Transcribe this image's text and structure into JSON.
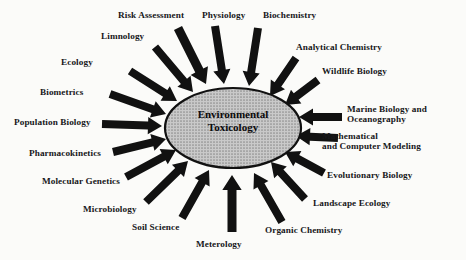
{
  "figure": {
    "type": "radial-convergence-diagram",
    "background_color": "#fbfbf9",
    "center": {
      "label": "Environmental\nToxicology",
      "line1": "Environmental",
      "line2": "Toxicology",
      "shape": "ellipse",
      "fill_color": "#a6a6a6",
      "fill_pattern": "halftone-dots",
      "stroke_color": "#111111",
      "cx": 233,
      "cy": 128,
      "rx": 68,
      "ry": 40
    },
    "arrow_color": "#111111",
    "arrow_style": "block-arrow",
    "contributing_field_count": 19,
    "nodes": [
      {
        "id": "risk-assessment",
        "label": "Risk Assessment",
        "label_x": 118,
        "label_y": 10,
        "arrow": {
          "x1": 178,
          "y1": 28,
          "x2": 206,
          "y2": 84,
          "width": 9,
          "head": 15
        }
      },
      {
        "id": "physiology",
        "label": "Physiology",
        "label_x": 202,
        "label_y": 10,
        "arrow": {
          "x1": 215,
          "y1": 26,
          "x2": 224,
          "y2": 84,
          "width": 8,
          "head": 14
        }
      },
      {
        "id": "biochemistry",
        "label": "Biochemistry",
        "label_x": 263,
        "label_y": 10,
        "arrow": {
          "x1": 258,
          "y1": 28,
          "x2": 249,
          "y2": 86,
          "width": 8,
          "head": 14
        }
      },
      {
        "id": "limnology",
        "label": "Limnology",
        "label_x": 101,
        "label_y": 31,
        "arrow": {
          "x1": 155,
          "y1": 47,
          "x2": 193,
          "y2": 92,
          "width": 8,
          "head": 14
        }
      },
      {
        "id": "analytical-chemistry",
        "label": "Analytical Chemistry",
        "label_x": 296,
        "label_y": 42,
        "arrow": {
          "x1": 296,
          "y1": 58,
          "x2": 270,
          "y2": 96,
          "width": 8,
          "head": 14
        }
      },
      {
        "id": "ecology",
        "label": "Ecology",
        "label_x": 61,
        "label_y": 57,
        "arrow": {
          "x1": 130,
          "y1": 71,
          "x2": 177,
          "y2": 101,
          "width": 8,
          "head": 14
        }
      },
      {
        "id": "wildlife-biology",
        "label": "Wildlife Biology",
        "label_x": 322,
        "label_y": 66,
        "arrow": {
          "x1": 318,
          "y1": 80,
          "x2": 285,
          "y2": 105,
          "width": 8,
          "head": 14
        }
      },
      {
        "id": "biometrics",
        "label": "Biometrics",
        "label_x": 40,
        "label_y": 87,
        "arrow": {
          "x1": 110,
          "y1": 94,
          "x2": 166,
          "y2": 114,
          "width": 8,
          "head": 14
        }
      },
      {
        "id": "marine-biology-oceanography",
        "label": "Marine Biology and\nOceanography",
        "label_line1": "Marine Biology and",
        "label_line2": "Oceanography",
        "label_x": 347,
        "label_y": 104,
        "arrow": {
          "x1": 342,
          "y1": 117,
          "x2": 299,
          "y2": 117,
          "width": 8,
          "head": 14
        }
      },
      {
        "id": "population-biology",
        "label": "Population Biology",
        "label_x": 14,
        "label_y": 117,
        "arrow": {
          "x1": 102,
          "y1": 124,
          "x2": 162,
          "y2": 126,
          "width": 8,
          "head": 14
        }
      },
      {
        "id": "mathematical-computer-modeling",
        "label": "Mathematical\nand Computer Modeling",
        "label_line1": "Mathematical",
        "label_line2": "and Computer Modeling",
        "label_x": 322,
        "label_y": 131,
        "arrow": {
          "x1": 338,
          "y1": 138,
          "x2": 296,
          "y2": 136,
          "width": 8,
          "head": 14
        }
      },
      {
        "id": "pharmacokinetics",
        "label": "Pharmacokinetics",
        "label_x": 29,
        "label_y": 148,
        "arrow": {
          "x1": 113,
          "y1": 152,
          "x2": 166,
          "y2": 139,
          "width": 8,
          "head": 14
        }
      },
      {
        "id": "evolutionary-biology",
        "label": "Evolutionary Biology",
        "label_x": 327,
        "label_y": 170,
        "arrow": {
          "x1": 324,
          "y1": 173,
          "x2": 285,
          "y2": 152,
          "width": 8,
          "head": 14
        }
      },
      {
        "id": "molecular-genetics",
        "label": "Molecular Genetics",
        "label_x": 42,
        "label_y": 176,
        "arrow": {
          "x1": 126,
          "y1": 177,
          "x2": 176,
          "y2": 150,
          "width": 8,
          "head": 14
        }
      },
      {
        "id": "landscape-ecology",
        "label": "Landscape Ecology",
        "label_x": 313,
        "label_y": 198,
        "arrow": {
          "x1": 305,
          "y1": 199,
          "x2": 271,
          "y2": 162,
          "width": 8,
          "head": 14
        }
      },
      {
        "id": "microbiology",
        "label": "Microbiology",
        "label_x": 83,
        "label_y": 204,
        "arrow": {
          "x1": 146,
          "y1": 202,
          "x2": 188,
          "y2": 161,
          "width": 8,
          "head": 14
        }
      },
      {
        "id": "organic-chemistry",
        "label": "Organic Chemistry",
        "label_x": 265,
        "label_y": 225,
        "arrow": {
          "x1": 282,
          "y1": 222,
          "x2": 254,
          "y2": 173,
          "width": 8,
          "head": 14
        }
      },
      {
        "id": "soil-science",
        "label": "Soil Science",
        "label_x": 132,
        "label_y": 222,
        "arrow": {
          "x1": 182,
          "y1": 218,
          "x2": 209,
          "y2": 170,
          "width": 8,
          "head": 14
        }
      },
      {
        "id": "meterology",
        "label": "Meterology",
        "label_x": 196,
        "label_y": 239,
        "arrow": {
          "x1": 232,
          "y1": 232,
          "x2": 232,
          "y2": 175,
          "width": 9,
          "head": 15
        }
      }
    ]
  }
}
